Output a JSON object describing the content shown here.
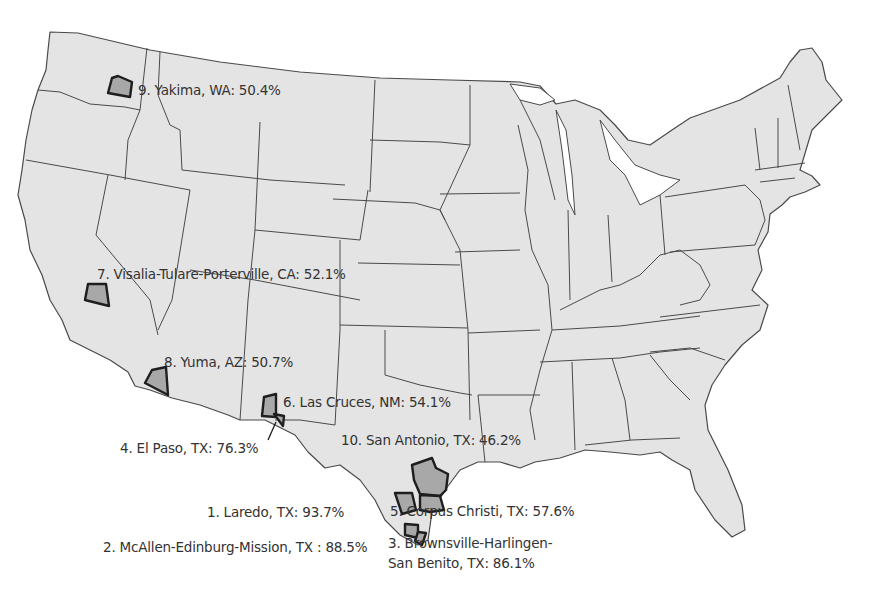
{
  "map": {
    "type": "choropleth-highlight",
    "region": "Contiguous United States",
    "colors": {
      "land": "#e4e4e4",
      "highlight": "#a8a8a8",
      "border": "#4a4a4a",
      "highlight_border": "#1e1e1e",
      "text": "#333333",
      "background": "#ffffff"
    },
    "labels": [
      {
        "rank": 1,
        "text": "1. Laredo, TX: 93.7%",
        "city": "Laredo",
        "state": "TX",
        "value": 93.7
      },
      {
        "rank": 2,
        "text": "2. McAllen-Edinburg-Mission, TX : 88.5%",
        "city": "McAllen-Edinburg-Mission",
        "state": "TX",
        "value": 88.5
      },
      {
        "rank": 3,
        "text_line1": "3. Brownsville-Harlingen-",
        "text_line2": "San Benito, TX: 86.1%",
        "city": "Brownsville-Harlingen-San Benito",
        "state": "TX",
        "value": 86.1
      },
      {
        "rank": 4,
        "text": "4. El Paso, TX: 76.3%",
        "city": "El Paso",
        "state": "TX",
        "value": 76.3
      },
      {
        "rank": 5,
        "text": "5. Corpus Christi, TX: 57.6%",
        "city": "Corpus Christi",
        "state": "TX",
        "value": 57.6
      },
      {
        "rank": 6,
        "text": "6. Las Cruces, NM: 54.1%",
        "city": "Las Cruces",
        "state": "NM",
        "value": 54.1
      },
      {
        "rank": 7,
        "text": "7. Visalia-Tulare-Porterville, CA: 52.1%",
        "city": "Visalia-Tulare-Porterville",
        "state": "CA",
        "value": 52.1
      },
      {
        "rank": 8,
        "text": "8. Yuma, AZ: 50.7%",
        "city": "Yuma",
        "state": "AZ",
        "value": 50.7
      },
      {
        "rank": 9,
        "text": "9. Yakima, WA: 50.4%",
        "city": "Yakima",
        "state": "WA",
        "value": 50.4
      },
      {
        "rank": 10,
        "text": "10. San Antonio, TX: 46.2%",
        "city": "San Antonio",
        "state": "TX",
        "value": 46.2
      }
    ]
  }
}
